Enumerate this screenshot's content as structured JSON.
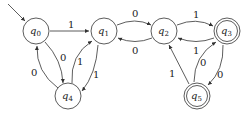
{
  "diagram": {
    "type": "finite-automaton",
    "start_state": "q0",
    "states": [
      {
        "id": "q0",
        "label": "q",
        "sub": "0",
        "accepting": false
      },
      {
        "id": "q1",
        "label": "q",
        "sub": "1",
        "accepting": false
      },
      {
        "id": "q2",
        "label": "q",
        "sub": "2",
        "accepting": false
      },
      {
        "id": "q3",
        "label": "q",
        "sub": "3",
        "accepting": true
      },
      {
        "id": "q4",
        "label": "q",
        "sub": "4",
        "accepting": false
      },
      {
        "id": "q5",
        "label": "q",
        "sub": "5",
        "accepting": true
      }
    ],
    "transitions": [
      {
        "from": "q0",
        "to": "q1",
        "label": "1"
      },
      {
        "from": "q0",
        "to": "q4",
        "label": "0"
      },
      {
        "from": "q4",
        "to": "q0",
        "label": "0"
      },
      {
        "from": "q4",
        "to": "q1",
        "label": "1"
      },
      {
        "from": "q1",
        "to": "q4",
        "label": "1"
      },
      {
        "from": "q1",
        "to": "q2",
        "label": "0"
      },
      {
        "from": "q2",
        "to": "q1",
        "label": "0"
      },
      {
        "from": "q2",
        "to": "q3",
        "label": "1"
      },
      {
        "from": "q3",
        "to": "q2",
        "label": "1"
      },
      {
        "from": "q5",
        "to": "q2",
        "label": "1"
      },
      {
        "from": "q5",
        "to": "q3",
        "label": "0"
      },
      {
        "from": "q3",
        "to": "q5",
        "label": "0"
      }
    ]
  }
}
